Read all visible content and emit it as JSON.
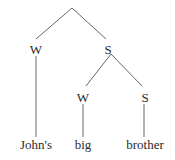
{
  "diagram": {
    "type": "metrical-tree",
    "root": {
      "x": 72,
      "y": 8
    },
    "nodes": [
      {
        "id": "w1",
        "label": "W",
        "x": 36,
        "y": 49
      },
      {
        "id": "s1",
        "label": "S",
        "x": 108,
        "y": 49
      },
      {
        "id": "w2",
        "label": "W",
        "x": 83,
        "y": 97
      },
      {
        "id": "s2",
        "label": "S",
        "x": 145,
        "y": 97
      }
    ],
    "words": [
      {
        "id": "johns",
        "text": "John's",
        "x": 36,
        "y": 149
      },
      {
        "id": "big",
        "text": "big",
        "x": 83,
        "y": 149
      },
      {
        "id": "brother",
        "text": "brother",
        "x": 145,
        "y": 149
      }
    ],
    "edge_color": "#555555",
    "text_color": "#2a2a2a"
  }
}
